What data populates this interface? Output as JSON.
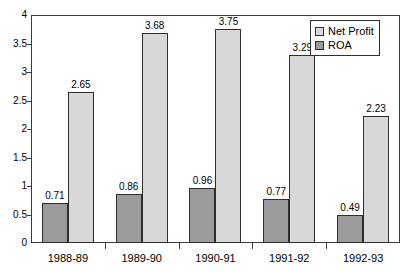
{
  "chart_data": {
    "type": "bar",
    "title": "",
    "xlabel": "",
    "ylabel": "",
    "ylim": [
      0,
      4
    ],
    "ytick_labels": [
      "0",
      "0.5",
      "1",
      "1.5",
      "2",
      "2.5",
      "3",
      "3.5",
      "4"
    ],
    "ytick_values": [
      0,
      0.5,
      1,
      1.5,
      2,
      2.5,
      3,
      3.5,
      4
    ],
    "grid": false,
    "legend_position": "top-right",
    "categories": [
      "1988-89",
      "1989-90",
      "1990-91",
      "1991-92",
      "1992-93"
    ],
    "series": [
      {
        "name": "ROA",
        "color": "#9b9b9b",
        "values": [
          0.71,
          0.86,
          0.96,
          0.77,
          0.49
        ],
        "labels": [
          "0.71",
          "0.86",
          "0.96",
          "0.77",
          "0.49"
        ]
      },
      {
        "name": "Net Profit",
        "color": "#d8d8d8",
        "values": [
          2.65,
          3.68,
          3.75,
          3.29,
          2.23
        ],
        "labels": [
          "2.65",
          "3.68",
          "3.75",
          "3.29",
          "2.23"
        ]
      }
    ]
  },
  "legend": {
    "items": [
      {
        "label": "Net Profit",
        "swatch": "netprofit"
      },
      {
        "label": "ROA",
        "swatch": "roa"
      }
    ]
  },
  "colors": {
    "roa_fill": "#9b9b9b",
    "net_profit_fill": "#d8d8d8",
    "axis": "#3a3a3a",
    "bar_stroke": "#2e2e2e",
    "background": "#ffffff"
  }
}
